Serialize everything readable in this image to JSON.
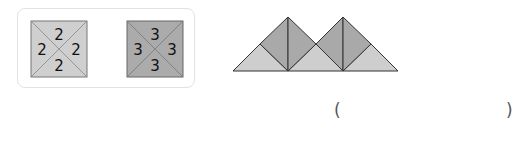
{
  "legend": {
    "tiles": [
      {
        "numbers": [
          "2",
          "2",
          "2",
          "2"
        ],
        "fill": "#cfcfcf"
      },
      {
        "numbers": [
          "3",
          "3",
          "3",
          "3"
        ],
        "fill": "#ababab"
      }
    ]
  },
  "figure": {
    "light_fill": "#cecece",
    "dark_fill": "#a9a9a9"
  },
  "answer": {
    "open_paren": "(",
    "close_paren": ")",
    "value": ""
  }
}
